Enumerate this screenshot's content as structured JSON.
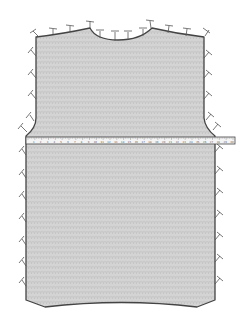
{
  "diagram": {
    "colors": {
      "fabric_fill": "#d4d4d4",
      "fabric_texture": "#bdbdbd",
      "outline": "#444444",
      "pin": "#555555",
      "tape_fill": "#f4f4f4",
      "tape_border": "#444444",
      "background": "#ffffff"
    },
    "garment": {
      "shape": "sweater back with shoulders, curved neckline, armhole shaping, and curved hem",
      "pin_count_top": 12,
      "pin_count_left": 12,
      "pin_count_right": 12
    },
    "tape_measure": {
      "orientation": "horizontal",
      "position": "across chest just below armholes",
      "tick_labels": [
        "1",
        "2",
        "3",
        "4",
        "5",
        "6",
        "7",
        "8",
        "9",
        "10",
        "11",
        "12",
        "13",
        "14",
        "15",
        "16",
        "17",
        "18",
        "19",
        "20",
        "21",
        "22",
        "23",
        "24",
        "25",
        "26",
        "27",
        "28",
        "29",
        "30"
      ]
    }
  }
}
